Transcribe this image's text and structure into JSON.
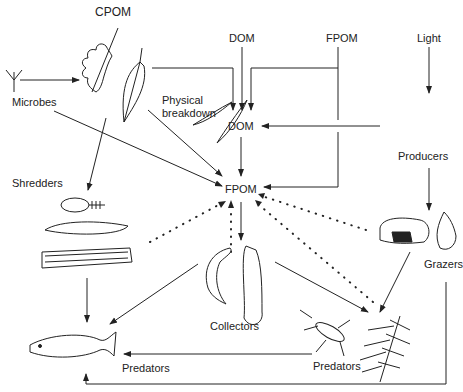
{
  "diagram": {
    "nodes": {
      "cpom": "CPOM",
      "dom_top": "DOM",
      "fpom_top": "FPOM",
      "light": "Light",
      "microbes": "Microbes",
      "physical_breakdown_1": "Physical",
      "physical_breakdown_2": "breakdown",
      "dom_mid": "DOM",
      "producers": "Producers",
      "shredders": "Shredders",
      "fpom_center": "FPOM",
      "grazers": "Grazers",
      "collectors": "Collectors",
      "predators_right": "Predators",
      "predators_left": "Predators"
    },
    "edges": [
      {
        "from": "Microbes",
        "to": "CPOM",
        "style": "solid"
      },
      {
        "from": "CPOM",
        "to": "DOM",
        "style": "solid"
      },
      {
        "from": "DOM (top)",
        "to": "DOM",
        "style": "solid"
      },
      {
        "from": "FPOM (top)",
        "to": "DOM",
        "style": "solid"
      },
      {
        "from": "FPOM (top)",
        "to": "FPOM",
        "style": "solid"
      },
      {
        "from": "Light",
        "to": "Producers",
        "style": "solid"
      },
      {
        "from": "Producers",
        "to": "DOM",
        "style": "solid"
      },
      {
        "from": "DOM",
        "to": "FPOM",
        "style": "solid"
      },
      {
        "from": "Microbes",
        "to": "FPOM",
        "style": "solid"
      },
      {
        "from": "CPOM",
        "to": "FPOM",
        "label": "Physical breakdown",
        "style": "solid"
      },
      {
        "from": "CPOM",
        "to": "Shredders",
        "style": "solid"
      },
      {
        "from": "Producers",
        "to": "Grazers",
        "style": "solid"
      },
      {
        "from": "FPOM",
        "to": "Collectors",
        "style": "solid"
      },
      {
        "from": "Shredders",
        "to": "FPOM",
        "style": "dotted"
      },
      {
        "from": "Collectors",
        "to": "FPOM",
        "style": "dotted"
      },
      {
        "from": "Grazers",
        "to": "FPOM",
        "style": "dotted"
      },
      {
        "from": "Predators (insects)",
        "to": "FPOM",
        "style": "dotted"
      },
      {
        "from": "Shredders",
        "to": "Predators (fish)",
        "style": "solid"
      },
      {
        "from": "Collectors",
        "to": "Predators (fish)",
        "style": "solid"
      },
      {
        "from": "Collectors",
        "to": "Predators (insects)",
        "style": "solid"
      },
      {
        "from": "Grazers",
        "to": "Predators (insects)",
        "style": "solid"
      },
      {
        "from": "Predators (insects)",
        "to": "Predators (fish)",
        "style": "solid"
      },
      {
        "from": "Grazers",
        "to": "Predators (fish)",
        "style": "solid"
      }
    ]
  }
}
